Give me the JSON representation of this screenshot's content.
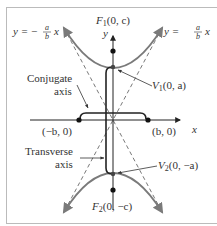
{
  "figure": {
    "type": "hyperbola-vertical-transverse",
    "colors": {
      "curve": "#7a7a7a",
      "axis": "#222222",
      "asymptote": "#555555",
      "frame": "#bbbbbb",
      "text": "#333333"
    }
  },
  "labels": {
    "focus_top": {
      "name": "F",
      "sub": "1",
      "coords": "(0, c)"
    },
    "focus_bottom": {
      "name": "F",
      "sub": "2",
      "coords": "(0, −c)"
    },
    "vertex_top": {
      "name": "V",
      "sub": "1",
      "coords": "(0, a)"
    },
    "vertex_bottom": {
      "name": "V",
      "sub": "2",
      "coords": "(0, −a)"
    },
    "co_vertex_left": "(−b, 0)",
    "co_vertex_right": "(b, 0)",
    "x_axis": "x",
    "y_axis": "y",
    "asymptote_left": {
      "lhs": "y = −",
      "num": "a",
      "den": "b",
      "var": "x"
    },
    "asymptote_right": {
      "lhs": "y =",
      "num": "a",
      "den": "b",
      "var": "x"
    },
    "conjugate_axis": [
      "Conjugate",
      "axis"
    ],
    "transverse_axis": [
      "Transverse",
      "axis"
    ]
  }
}
